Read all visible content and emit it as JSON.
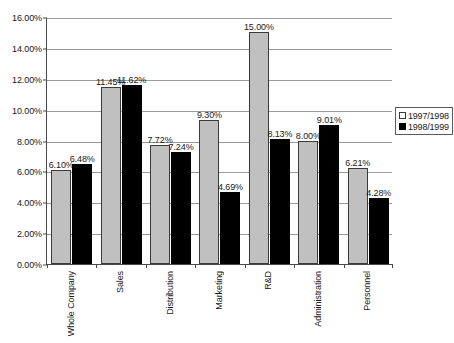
{
  "chart_data": {
    "type": "bar",
    "title": "",
    "xlabel": "",
    "ylabel": "",
    "ylim": [
      0,
      16
    ],
    "ytick_values": [
      0,
      2,
      4,
      6,
      8,
      10,
      12,
      14,
      16
    ],
    "ytick_labels": [
      "0.00%",
      "2.00%",
      "4.00%",
      "6.00%",
      "8.00%",
      "10.00%",
      "12.00%",
      "14.00%",
      "16.00%"
    ],
    "grid": true,
    "legend_position": "right",
    "categories": [
      "Whole Company",
      "Sales",
      "Distribution",
      "Marketing",
      "R&D",
      "Administration",
      "Personnel"
    ],
    "series": [
      {
        "name": "1997/1998",
        "color": "#c0c0c0",
        "values": [
          6.1,
          11.45,
          7.72,
          9.3,
          15.0,
          8.0,
          6.21
        ],
        "labels": [
          "6.10%",
          "11.45%",
          "7.72%",
          "9.30%",
          "15.00%",
          "8.00%",
          "6.21%"
        ]
      },
      {
        "name": "1998/1999",
        "color": "#000000",
        "values": [
          6.48,
          11.62,
          7.24,
          4.69,
          8.13,
          9.01,
          4.28
        ],
        "labels": [
          "6.48%",
          "11.62%",
          "7.24%",
          "4.69%",
          "8.13%",
          "9.01%",
          "4.28%"
        ]
      }
    ]
  }
}
